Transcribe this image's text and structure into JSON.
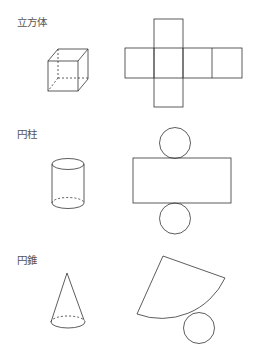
{
  "sections": [
    {
      "label": "立方体",
      "shape": "cube",
      "net": "cube-net-cross"
    },
    {
      "label": "円柱",
      "shape": "cylinder",
      "net": "rectangle-with-two-circles"
    },
    {
      "label": "円錐",
      "shape": "cone",
      "net": "sector-with-circle"
    }
  ],
  "colors": {
    "stroke": "#333333",
    "text": "#555555",
    "background": "#ffffff"
  }
}
